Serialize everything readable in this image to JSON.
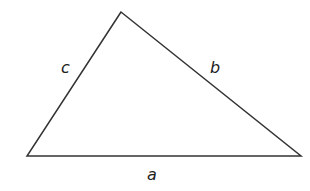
{
  "diagram": {
    "type": "triangle",
    "stroke_color": "#333333",
    "background_color": "#ffffff",
    "vertices": {
      "top": {
        "x": 121,
        "y": 12
      },
      "bottom_left": {
        "x": 27,
        "y": 156
      },
      "bottom_right": {
        "x": 301,
        "y": 156
      }
    },
    "sides": [
      {
        "name": "a",
        "label": "a",
        "between": [
          "bottom_left",
          "bottom_right"
        ],
        "label_position": {
          "x": 152,
          "y": 180
        }
      },
      {
        "name": "b",
        "label": "b",
        "between": [
          "top",
          "bottom_right"
        ],
        "label_position": {
          "x": 216,
          "y": 73
        }
      },
      {
        "name": "c",
        "label": "c",
        "between": [
          "top",
          "bottom_left"
        ],
        "label_position": {
          "x": 66,
          "y": 73
        }
      }
    ]
  }
}
